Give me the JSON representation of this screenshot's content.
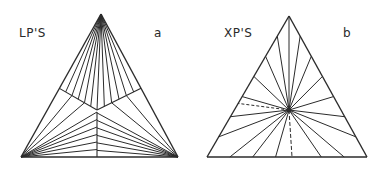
{
  "panels": [
    {
      "id": "a",
      "title": "LP'S",
      "letter": "a",
      "triangle": {
        "apex": [
          101,
          14
        ],
        "left": [
          21,
          157
        ],
        "right": [
          178,
          157
        ]
      },
      "junction": [
        97,
        110
      ],
      "regions": {
        "top_fan_apex": [
          101,
          14
        ],
        "left_fan_vertex": [
          21,
          157
        ],
        "right_fan_vertex": [
          178,
          157
        ]
      }
    },
    {
      "id": "b",
      "title": "XP'S",
      "letter": "b",
      "triangle": {
        "apex": [
          289,
          16
        ],
        "left": [
          207,
          157
        ],
        "right": [
          367,
          157
        ]
      },
      "center": [
        289,
        110
      ]
    }
  ],
  "colors": {
    "line": "#2b2b2b",
    "background": "#ffffff"
  }
}
